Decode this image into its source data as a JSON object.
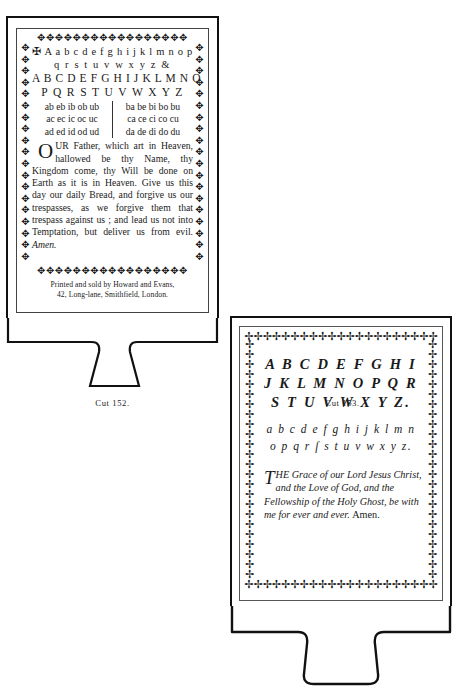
{
  "plates": {
    "left": {
      "caption": "Cut 152.",
      "alphabet_rows": [
        "✠ A a b c d e f g h i j k l m n o p",
        "q r s t u v w x y z &",
        "A B C D E F G H I J K L M N O",
        "P Q R S T U V W X Y Z"
      ],
      "syllabarium": [
        {
          "left": "ab eb ib ob ub",
          "right": "ba be bi bo bu"
        },
        {
          "left": "ac ec ic oc uc",
          "right": "ca ce ci co cu"
        },
        {
          "left": "ad ed id od ud",
          "right": "da de di do du"
        }
      ],
      "prayer": {
        "dropcap": "O",
        "body": "UR Father, which art in Heaven, hallowed be thy Name, thy Kingdom come, thy Will be done on Earth as it is in Heaven. Give us this day our daily Bread, and forgive us our trespasses, as we forgive them that trespass against us ; and lead us not into Temptation, but deliver us from evil.",
        "amen": "Amen."
      },
      "imprint": [
        "Printed and sold by Howard and Evans,",
        "42, Long-lane, Smithfield, London."
      ],
      "ornament_glyph": "✥"
    },
    "right": {
      "caption": "Cut 153.",
      "capital_rows": [
        "A B C D E F G H I",
        "J K L M N O P Q R",
        "S T U V W X Y Z."
      ],
      "lowercase_rows": [
        "a b c d e f g h i j k l m n",
        "o p q r ſ s t u v w x y z."
      ],
      "grace": {
        "dropcap": "T",
        "body": "HE Grace of our Lord Jesus Christ, and the Love of God, and the Fellowship of the Holy Ghost, be with me for ever and ever.",
        "amen": "Amen."
      },
      "ornament_glyph": "✢"
    }
  }
}
